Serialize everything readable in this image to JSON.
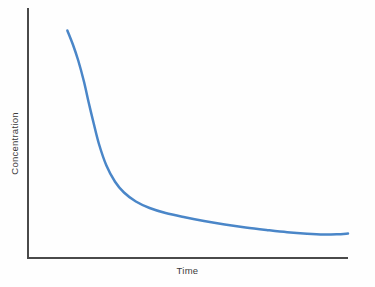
{
  "chart_data": {
    "type": "line",
    "title": "",
    "subtitle": "",
    "xlabel": "Time",
    "ylabel": "Concentration",
    "grid": false,
    "legend": null,
    "legend_position": "none",
    "x_tick_labels": [],
    "y_tick_labels": [],
    "xlim": [
      0,
      1
    ],
    "ylim": [
      0,
      1
    ],
    "annotations": [],
    "series": [
      {
        "name": "Concentration over time",
        "color": "#4a86c8",
        "line_width": 2.5,
        "x": [
          0.123,
          0.14,
          0.157,
          0.175,
          0.19,
          0.205,
          0.222,
          0.245,
          0.272,
          0.3,
          0.337,
          0.38,
          0.43,
          0.49,
          0.55,
          0.615,
          0.68,
          0.745,
          0.81,
          0.872,
          0.925,
          0.965,
          1.0
        ],
        "y": [
          0.91,
          0.855,
          0.79,
          0.705,
          0.62,
          0.54,
          0.455,
          0.37,
          0.305,
          0.262,
          0.226,
          0.2,
          0.18,
          0.163,
          0.148,
          0.134,
          0.122,
          0.112,
          0.103,
          0.097,
          0.094,
          0.095,
          0.098
        ],
        "points_px": [
          [
            67,
            28
          ],
          [
            73,
            41
          ],
          [
            79,
            56
          ],
          [
            85,
            76
          ],
          [
            90,
            96
          ],
          [
            95,
            114
          ],
          [
            101,
            134
          ],
          [
            109,
            154
          ],
          [
            118,
            169
          ],
          [
            128,
            179
          ],
          [
            141,
            188
          ],
          [
            156,
            194
          ],
          [
            174,
            199
          ],
          [
            195,
            203
          ],
          [
            216,
            206
          ],
          [
            239,
            210
          ],
          [
            262,
            213
          ],
          [
            285,
            215
          ],
          [
            308,
            217
          ],
          [
            330,
            219
          ],
          [
            349,
            219
          ],
          [
            363,
            219
          ],
          [
            363,
            232
          ]
        ]
      }
    ]
  },
  "axes": {
    "axis_color": "#4a4a4a",
    "axis_width": 2,
    "y_axis_top_px": 8,
    "y_axis_bottom_px": 258,
    "x_axis_left_px": 28,
    "x_axis_right_px": 348
  },
  "canvas": {
    "background": "#fefefe",
    "width": 375,
    "height": 287
  }
}
